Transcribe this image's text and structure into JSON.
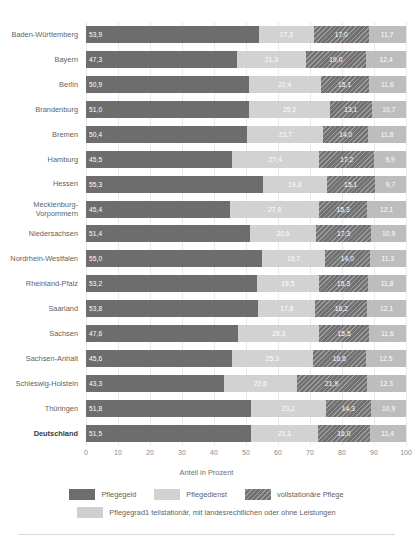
{
  "chart_data": {
    "type": "bar",
    "orientation": "horizontal",
    "stacked": true,
    "title": "",
    "xlabel": "Anteil in Prozent",
    "ylabel": "",
    "xlim": [
      0,
      100
    ],
    "xticks": [
      0,
      10,
      20,
      30,
      40,
      50,
      60,
      70,
      80,
      90,
      100
    ],
    "grid": true,
    "legend_position": "bottom",
    "categories": [
      "Baden-Württemberg",
      "Bayern",
      "Berlin",
      "Brandenburg",
      "Bremen",
      "Hamburg",
      "Hessen",
      "Mecklenburg-Vorpommern",
      "Niedersachsen",
      "Nordrhein-Westfalen",
      "Rheinland-Pfalz",
      "Saarland",
      "Sachsen",
      "Sachsen-Anhalt",
      "Schleswig-Holstein",
      "Thüringen",
      "Deutschland"
    ],
    "series": [
      {
        "name": "Pflegegeld",
        "color": "#6d6d6d",
        "values": [
          53.9,
          47.3,
          50.9,
          51.0,
          50.4,
          45.5,
          55.3,
          45.4,
          51.4,
          55.0,
          53.2,
          53.8,
          47.6,
          45.6,
          43.3,
          51.8,
          51.5
        ],
        "labels": [
          "53,9",
          "47,3",
          "50,9",
          "51,0",
          "50,4",
          "45,5",
          "55,3",
          "45,4",
          "51,4",
          "55,0",
          "53,2",
          "53,8",
          "47,6",
          "45,6",
          "43,3",
          "51,8",
          "51,5"
        ]
      },
      {
        "name": "Pflegedienst",
        "color": "#d2d2d2",
        "values": [
          17.3,
          21.3,
          22.4,
          25.2,
          23.7,
          27.4,
          19.8,
          27.8,
          20.6,
          19.7,
          19.5,
          17.8,
          25.3,
          25.3,
          22.6,
          23.2,
          21.1
        ],
        "labels": [
          "17,3",
          "21,3",
          "22,4",
          "25,2",
          "23,7",
          "27,4",
          "19,8",
          "27,8",
          "20,6",
          "19,7",
          "19,5",
          "17,8",
          "25,3",
          "25,3",
          "22,6",
          "23,2",
          "21,1"
        ]
      },
      {
        "name": "vollstationäre Pflege",
        "color": "#717171",
        "hatch": true,
        "values": [
          17.0,
          19.0,
          15.1,
          13.1,
          14.0,
          17.2,
          15.1,
          15.3,
          17.3,
          14.0,
          15.3,
          16.2,
          15.5,
          16.6,
          21.9,
          14.3,
          16.0
        ],
        "labels": [
          "17,0",
          "19,0",
          "15,1",
          "13,1",
          "14,0",
          "17,2",
          "15,1",
          "15,3",
          "17,3",
          "14,0",
          "15,3",
          "16,2",
          "15,5",
          "16,6",
          "21,9",
          "14,3",
          "16,0"
        ]
      },
      {
        "name": "Pflegegrad1 teilstationär, mit landesrechtlichen oder ohne Leistungen",
        "color": "#bdbdbd",
        "values": [
          11.7,
          12.4,
          11.6,
          10.7,
          11.8,
          9.9,
          9.7,
          12.1,
          10.9,
          11.3,
          11.8,
          12.1,
          11.6,
          12.5,
          12.3,
          10.9,
          11.4
        ],
        "labels": [
          "11,7",
          "12,4",
          "11,6",
          "10,7",
          "11,8",
          "9,9",
          "9,7",
          "12,1",
          "10,9",
          "11,3",
          "11,8",
          "12,1",
          "11,6",
          "12,5",
          "12,3",
          "10,9",
          "11,4"
        ]
      }
    ]
  },
  "legend": {
    "items": [
      {
        "label": "Pflegegeld",
        "swatch": "s0"
      },
      {
        "label": "Pflegedienst",
        "swatch": "s1"
      },
      {
        "label": "vollstationäre Pflege",
        "swatch": "s2"
      },
      {
        "label": "Pflegegrad1 teilstationär, mit landesrechtlichen oder ohne Leistungen",
        "swatch": "s3"
      }
    ]
  },
  "axis": {
    "x_label": "Anteil in Prozent"
  }
}
